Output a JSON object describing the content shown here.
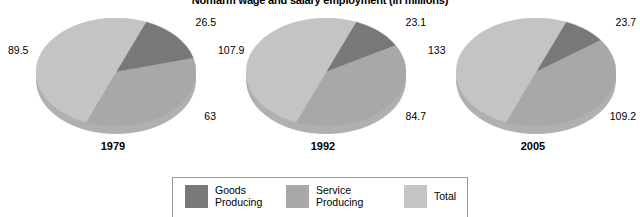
{
  "chart_data": {
    "type": "pie",
    "title": "Nonfarm wage and salary employment (in millions)",
    "xlabel": "",
    "ylabel": "",
    "legend_position": "bottom",
    "grid": false,
    "categories": [
      "Goods Producing",
      "Service Producing",
      "Total"
    ],
    "colors": {
      "goods_producing": "#787878",
      "service_producing": "#a8a8a8",
      "total": "#c4c4c4",
      "shadow": "#b0b0b0",
      "legend_border": "#9a9a9a",
      "background": "#ffffff",
      "text": "#000000"
    },
    "charts": [
      {
        "year": "1979",
        "slices": [
          {
            "name": "Goods Producing",
            "value": 26.5,
            "label": "26.5"
          },
          {
            "name": "Service Producing",
            "value": 63,
            "label": "63"
          },
          {
            "name": "Total",
            "value": 89.5,
            "label": "89.5"
          }
        ]
      },
      {
        "year": "1992",
        "slices": [
          {
            "name": "Goods Producing",
            "value": 23.1,
            "label": "23.1"
          },
          {
            "name": "Service Producing",
            "value": 84.7,
            "label": "84.7"
          },
          {
            "name": "Total",
            "value": 107.9,
            "label": "107.9"
          }
        ]
      },
      {
        "year": "2005",
        "slices": [
          {
            "name": "Goods Producing",
            "value": 23.7,
            "label": "23.7"
          },
          {
            "name": "Service Producing",
            "value": 109.2,
            "label": "109.2"
          },
          {
            "name": "Total",
            "value": 133,
            "label": "133"
          }
        ]
      }
    ]
  },
  "legend": {
    "items": [
      {
        "label": "Goods\nProducing",
        "color": "#787878"
      },
      {
        "label": "Service\nProducing",
        "color": "#a8a8a8"
      },
      {
        "label": "Total",
        "color": "#c4c4c4"
      }
    ]
  }
}
